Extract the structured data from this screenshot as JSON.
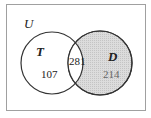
{
  "diagram": {
    "type": "venn",
    "universe_label": "U",
    "sets": [
      {
        "name": "T",
        "only_count": "107",
        "shaded": false
      },
      {
        "name": "D",
        "only_count": "214",
        "shaded": true
      }
    ],
    "intersection_count": "281",
    "colors": {
      "border": "#9a9a9a",
      "circle_stroke": "#333333",
      "shade": "#d4d4d4",
      "text": "#222222",
      "shaded_text": "#666666"
    }
  }
}
